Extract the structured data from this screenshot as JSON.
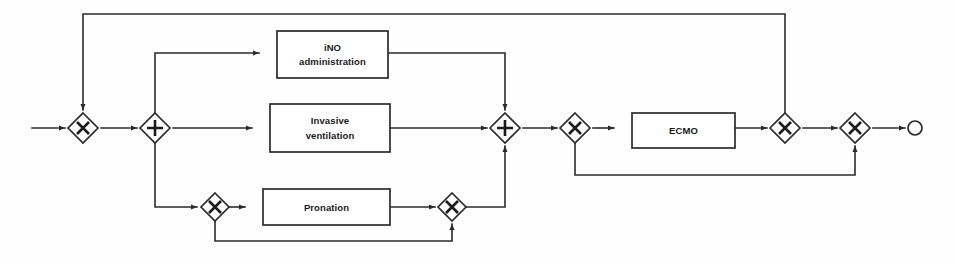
{
  "diagram": {
    "kind": "process-flow-diagram",
    "notation": "BPMN-style",
    "title": "",
    "canvas": {
      "width": 954,
      "height": 263,
      "background": "#ffffff"
    },
    "colors": {
      "stroke": "#2b2b2b",
      "glyph": "#1a1a1a",
      "shape_fill": "#ffffff",
      "text": "#1a1a1a"
    },
    "tasks": [
      {
        "id": "task-ino",
        "lines": [
          "iNO",
          "administration"
        ],
        "x": 277,
        "y": 31,
        "w": 111,
        "h": 47
      },
      {
        "id": "task-invasive-ventilation",
        "lines": [
          "Invasive",
          "ventilation"
        ],
        "x": 270,
        "y": 104,
        "w": 120,
        "h": 48
      },
      {
        "id": "task-pronation",
        "lines": [
          "Pronation"
        ],
        "x": 263,
        "y": 189,
        "w": 127,
        "h": 36
      },
      {
        "id": "task-ecmo",
        "lines": [
          "ECMO"
        ],
        "x": 632,
        "y": 113,
        "w": 103,
        "h": 35
      }
    ],
    "gateways": [
      {
        "id": "gw-entry-merge",
        "type": "exclusive",
        "glyph": "X",
        "cx": 83,
        "cy": 128,
        "r": 15
      },
      {
        "id": "gw-parallel-split",
        "type": "parallel",
        "glyph": "+",
        "cx": 155,
        "cy": 128,
        "r": 15
      },
      {
        "id": "gw-pronation-split",
        "type": "exclusive",
        "glyph": "X",
        "cx": 215,
        "cy": 207,
        "r": 14
      },
      {
        "id": "gw-pronation-merge",
        "type": "exclusive",
        "glyph": "X",
        "cx": 452,
        "cy": 207,
        "r": 14
      },
      {
        "id": "gw-parallel-join",
        "type": "parallel",
        "glyph": "+",
        "cx": 505,
        "cy": 128,
        "r": 15
      },
      {
        "id": "gw-ecmo-split",
        "type": "exclusive",
        "glyph": "X",
        "cx": 575,
        "cy": 128,
        "r": 15
      },
      {
        "id": "gw-ecmo-merge",
        "type": "exclusive",
        "glyph": "X",
        "cx": 785,
        "cy": 128,
        "r": 15
      },
      {
        "id": "gw-final-merge",
        "type": "exclusive",
        "glyph": "X",
        "cx": 855,
        "cy": 128,
        "r": 15
      }
    ],
    "events": [
      {
        "id": "event-end",
        "type": "end-event",
        "cx": 915,
        "cy": 128,
        "r": 7
      }
    ],
    "connections": [
      {
        "id": "flow-start-in",
        "from": "start-edge",
        "to": "gw-entry-merge"
      },
      {
        "id": "flow-entry-to-split",
        "from": "gw-entry-merge",
        "to": "gw-parallel-split"
      },
      {
        "id": "flow-split-to-ino",
        "from": "gw-parallel-split",
        "to": "task-ino"
      },
      {
        "id": "flow-split-to-ventilation",
        "from": "gw-parallel-split",
        "to": "task-invasive-ventilation"
      },
      {
        "id": "flow-split-to-pronation-gw",
        "from": "gw-parallel-split",
        "to": "gw-pronation-split"
      },
      {
        "id": "flow-ino-to-join",
        "from": "task-ino",
        "to": "gw-parallel-join"
      },
      {
        "id": "flow-ventilation-to-join",
        "from": "task-invasive-ventilation",
        "to": "gw-parallel-join"
      },
      {
        "id": "flow-pronation-gw-to-task",
        "from": "gw-pronation-split",
        "to": "task-pronation"
      },
      {
        "id": "flow-pronation-to-merge",
        "from": "task-pronation",
        "to": "gw-pronation-merge"
      },
      {
        "id": "flow-pronation-bypass",
        "from": "gw-pronation-split",
        "to": "gw-pronation-merge"
      },
      {
        "id": "flow-pronation-merge-to-join",
        "from": "gw-pronation-merge",
        "to": "gw-parallel-join"
      },
      {
        "id": "flow-join-to-ecmo-split",
        "from": "gw-parallel-join",
        "to": "gw-ecmo-split"
      },
      {
        "id": "flow-ecmo-split-to-ecmo",
        "from": "gw-ecmo-split",
        "to": "task-ecmo"
      },
      {
        "id": "flow-ecmo-to-merge",
        "from": "task-ecmo",
        "to": "gw-ecmo-merge"
      },
      {
        "id": "flow-ecmo-bypass",
        "from": "gw-ecmo-split",
        "to": "gw-final-merge"
      },
      {
        "id": "flow-ecmo-merge-to-final",
        "from": "gw-ecmo-merge",
        "to": "gw-final-merge"
      },
      {
        "id": "flow-final-to-end",
        "from": "gw-final-merge",
        "to": "event-end"
      },
      {
        "id": "flow-global-feedback",
        "from": "gw-ecmo-merge",
        "to": "gw-entry-merge"
      }
    ]
  }
}
